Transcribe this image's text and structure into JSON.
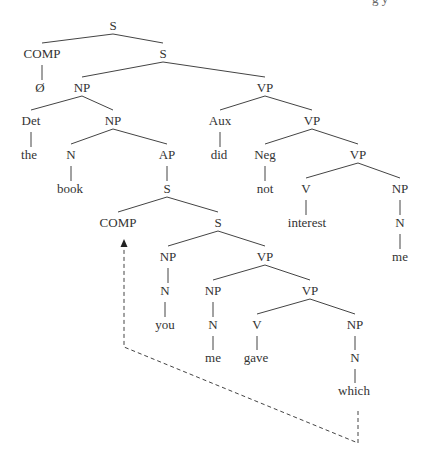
{
  "header": {
    "clipped_text": "g      y"
  },
  "tree": {
    "nodes": [
      {
        "id": "s0",
        "label": "S",
        "x": 113,
        "y": 29
      },
      {
        "id": "comp1",
        "label": "COMP",
        "x": 42,
        "y": 57
      },
      {
        "id": "empty",
        "label": "Ø",
        "x": 40,
        "y": 91
      },
      {
        "id": "s1",
        "label": "S",
        "x": 163,
        "y": 57
      },
      {
        "id": "np1",
        "label": "NP",
        "x": 82,
        "y": 91
      },
      {
        "id": "det",
        "label": "Det",
        "x": 31,
        "y": 124
      },
      {
        "id": "the",
        "label": "the",
        "x": 29,
        "y": 158
      },
      {
        "id": "np2",
        "label": "NP",
        "x": 113,
        "y": 124
      },
      {
        "id": "n1",
        "label": "N",
        "x": 71,
        "y": 158
      },
      {
        "id": "book",
        "label": "book",
        "x": 70,
        "y": 192
      },
      {
        "id": "ap",
        "label": "AP",
        "x": 167,
        "y": 158
      },
      {
        "id": "s2",
        "label": "S",
        "x": 167,
        "y": 192
      },
      {
        "id": "comp2",
        "label": "COMP",
        "x": 118,
        "y": 226
      },
      {
        "id": "s3",
        "label": "S",
        "x": 218,
        "y": 226
      },
      {
        "id": "np3",
        "label": "NP",
        "x": 168,
        "y": 260
      },
      {
        "id": "n2",
        "label": "N",
        "x": 165,
        "y": 294
      },
      {
        "id": "you",
        "label": "you",
        "x": 165,
        "y": 328
      },
      {
        "id": "vp4",
        "label": "VP",
        "x": 265,
        "y": 260
      },
      {
        "id": "np4",
        "label": "NP",
        "x": 213,
        "y": 294
      },
      {
        "id": "n3",
        "label": "N",
        "x": 213,
        "y": 328
      },
      {
        "id": "me2",
        "label": "me",
        "x": 213,
        "y": 361
      },
      {
        "id": "vp5",
        "label": "VP",
        "x": 310,
        "y": 294
      },
      {
        "id": "v2",
        "label": "V",
        "x": 257,
        "y": 328
      },
      {
        "id": "gave",
        "label": "gave",
        "x": 256,
        "y": 361
      },
      {
        "id": "np5",
        "label": "NP",
        "x": 355,
        "y": 328
      },
      {
        "id": "n4",
        "label": "N",
        "x": 355,
        "y": 361
      },
      {
        "id": "which",
        "label": "which",
        "x": 354,
        "y": 394
      },
      {
        "id": "vp1",
        "label": "VP",
        "x": 265,
        "y": 91
      },
      {
        "id": "aux",
        "label": "Aux",
        "x": 220,
        "y": 124
      },
      {
        "id": "did",
        "label": "did",
        "x": 219,
        "y": 158
      },
      {
        "id": "vp2",
        "label": "VP",
        "x": 312,
        "y": 124
      },
      {
        "id": "neg",
        "label": "Neg",
        "x": 265,
        "y": 158
      },
      {
        "id": "not",
        "label": "not",
        "x": 265,
        "y": 192
      },
      {
        "id": "vp3",
        "label": "VP",
        "x": 358,
        "y": 158
      },
      {
        "id": "v1",
        "label": "V",
        "x": 306,
        "y": 192
      },
      {
        "id": "interest",
        "label": "interest",
        "x": 307,
        "y": 226
      },
      {
        "id": "np6",
        "label": "NP",
        "x": 400,
        "y": 192
      },
      {
        "id": "n5",
        "label": "N",
        "x": 400,
        "y": 226
      },
      {
        "id": "me1",
        "label": "me",
        "x": 400,
        "y": 260
      }
    ],
    "edges": [
      [
        "s0",
        "comp1"
      ],
      [
        "s0",
        "s1"
      ],
      [
        "comp1",
        "empty"
      ],
      [
        "s1",
        "np1"
      ],
      [
        "s1",
        "vp1"
      ],
      [
        "np1",
        "det"
      ],
      [
        "np1",
        "np2"
      ],
      [
        "det",
        "the"
      ],
      [
        "np2",
        "n1"
      ],
      [
        "np2",
        "ap"
      ],
      [
        "n1",
        "book"
      ],
      [
        "ap",
        "s2"
      ],
      [
        "s2",
        "comp2"
      ],
      [
        "s2",
        "s3"
      ],
      [
        "s3",
        "np3"
      ],
      [
        "s3",
        "vp4"
      ],
      [
        "np3",
        "n2"
      ],
      [
        "n2",
        "you"
      ],
      [
        "vp4",
        "np4"
      ],
      [
        "vp4",
        "vp5"
      ],
      [
        "np4",
        "n3"
      ],
      [
        "n3",
        "me2"
      ],
      [
        "vp5",
        "v2"
      ],
      [
        "vp5",
        "np5"
      ],
      [
        "v2",
        "gave"
      ],
      [
        "np5",
        "n4"
      ],
      [
        "n4",
        "which"
      ],
      [
        "vp1",
        "aux"
      ],
      [
        "vp1",
        "vp2"
      ],
      [
        "aux",
        "did"
      ],
      [
        "vp2",
        "neg"
      ],
      [
        "vp2",
        "vp3"
      ],
      [
        "neg",
        "not"
      ],
      [
        "vp3",
        "v1"
      ],
      [
        "vp3",
        "np6"
      ],
      [
        "v1",
        "interest"
      ],
      [
        "np6",
        "n5"
      ],
      [
        "n5",
        "me1"
      ]
    ],
    "movement_arrow": {
      "from": "which",
      "to": "comp2",
      "style": "dashed",
      "points": [
        [
          358,
          411
        ],
        [
          358,
          443
        ],
        [
          124,
          347
        ],
        [
          124,
          246
        ]
      ]
    }
  }
}
